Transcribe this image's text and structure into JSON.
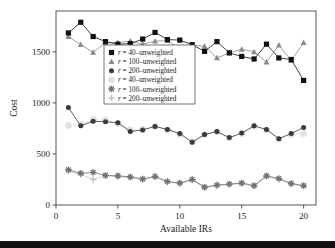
{
  "figure": {
    "background": "#ffffff",
    "frame_color": "#444444",
    "bottom_bar_color": "#111111"
  },
  "chart_data": {
    "type": "line",
    "title": "",
    "xlabel": "Available IRs",
    "ylabel": "Cost",
    "xlim": [
      0,
      21
    ],
    "ylim": [
      0,
      1900
    ],
    "xticks": [
      0,
      5,
      10,
      15,
      20
    ],
    "yticks": [
      0,
      500,
      1000,
      1500
    ],
    "xtick_labels": [
      "0",
      "5",
      "10",
      "15",
      "20"
    ],
    "ytick_labels": [
      "0",
      "500",
      "1000",
      "1500"
    ],
    "grid": false,
    "legend_position": "upper-center-left",
    "x": [
      1,
      2,
      3,
      4,
      5,
      6,
      7,
      8,
      9,
      10,
      11,
      12,
      13,
      14,
      15,
      16,
      17,
      18,
      19,
      20
    ],
    "series": [
      {
        "name": "r = 40-unweighted",
        "label_prefix": "r",
        "label_rest": " = 40–unweighted",
        "marker": "square",
        "color": "#111111",
        "values": [
          1685,
          1790,
          1650,
          1600,
          1575,
          1580,
          1625,
          1690,
          1620,
          1615,
          1570,
          1505,
          1600,
          1490,
          1455,
          1430,
          1575,
          1440,
          1425,
          1220
        ]
      },
      {
        "name": "r = 100-unweighted",
        "label_prefix": "r",
        "label_rest": " = 100–unweighted",
        "marker": "triangle",
        "color": "#8a8a8a",
        "values": [
          1650,
          1570,
          1495,
          1590,
          1590,
          1605,
          1575,
          1605,
          1610,
          1530,
          1565,
          1555,
          1440,
          1490,
          1525,
          1500,
          1400,
          1565,
          1415,
          1590
        ]
      },
      {
        "name": "r = 200-unweighted",
        "label_prefix": "r",
        "label_rest": " = 200–unweighted",
        "marker": "circle",
        "color": "#3a3a3a",
        "values": [
          955,
          775,
          820,
          815,
          805,
          720,
          735,
          770,
          740,
          700,
          615,
          690,
          720,
          660,
          705,
          775,
          740,
          650,
          700,
          760
        ]
      },
      {
        "name": "r = 40-unweighted",
        "label_prefix": "r",
        "label_rest": " = 40–unweighted",
        "marker": "circle-light",
        "color": "#e2e2e2",
        "values": [
          780,
          790,
          835,
          830,
          800,
          735,
          740,
          770,
          735,
          690,
          620,
          690,
          715,
          655,
          700,
          770,
          735,
          645,
          690,
          700
        ]
      },
      {
        "name": "r = 100-unweighted",
        "label_prefix": "r",
        "label_rest": " = 100–unweighted",
        "marker": "star",
        "color": "#707070",
        "values": [
          345,
          310,
          320,
          290,
          285,
          275,
          255,
          280,
          230,
          215,
          250,
          175,
          195,
          205,
          215,
          190,
          285,
          260,
          210,
          190
        ]
      },
      {
        "name": "r = 200-unweighted",
        "label_prefix": "r",
        "label_rest": " = 200–unweighted",
        "marker": "plus-light",
        "color": "#c4c4c4",
        "values": [
          330,
          300,
          250,
          285,
          280,
          270,
          250,
          275,
          225,
          210,
          245,
          170,
          190,
          200,
          210,
          185,
          280,
          250,
          205,
          185
        ]
      }
    ]
  }
}
